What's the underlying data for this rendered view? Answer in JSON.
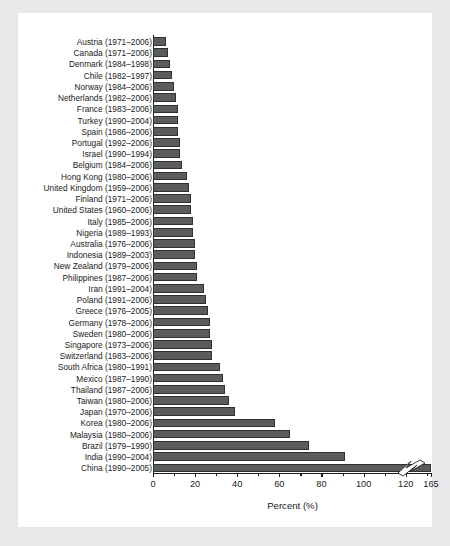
{
  "figure": {
    "axis_title": "Percent (%)",
    "bar_color": "#5c5c5c",
    "bar_edge_color": "#303030",
    "panel_background": "#ffffff",
    "page_background": "#e8e8ea",
    "break_symbol": "axis-break-zigzag"
  },
  "chart_data": {
    "type": "bar",
    "orientation": "horizontal",
    "title": "",
    "xlabel": "Percent (%)",
    "ylabel": "",
    "xlim": [
      0,
      132
    ],
    "grid": false,
    "legend": "none",
    "axis_break": {
      "present": true,
      "note": "Last tick labeled 165 although positioned at the 132 gridline; China bar is truncated with a zigzag break symbol.",
      "broken_category": "China (1990–2005)"
    },
    "xticks": [
      0,
      20,
      40,
      60,
      80,
      100,
      120,
      132
    ],
    "xticklabels": [
      "0",
      "20",
      "40",
      "60",
      "80",
      "100",
      "120",
      "165"
    ],
    "categories": [
      "Austria (1971–2006)",
      "Canada (1971–2006)",
      "Denmark  (1984–1998)",
      "Chile (1982–1997)",
      "Norway (1984–2006)",
      "Netherlands (1982–2006)",
      "France (1983–2006)",
      "Turkey (1990–2004)",
      "Spain (1986–2006)",
      "Portugal (1992–2006)",
      "Israel (1990–1994)",
      "Belgium (1984–2006)",
      "Hong Kong (1980–2006)",
      "United Kingdom (1959–2006)",
      "Finland (1971–2006)",
      "United States (1960–2006)",
      "Italy (1985–2006)",
      "Nigeria (1989–1993)",
      "Australia (1976–2006)",
      "Indonesia (1989–2003)",
      "New Zealand (1979–2006)",
      "Philippines (1987–2006)",
      "Iran (1991–2004)",
      "Poland (1991–2006)",
      "Greece (1976–2005)",
      "Germany (1978–2006)",
      "Sweden (1980–2006)",
      "Singapore (1973–2006)",
      "Switzerland (1983–2006)",
      "South Africa (1980–1991)",
      "Mexico (1987–1990)",
      "Thailand (1987–2006)",
      "Taiwan (1980–2006)",
      "Japan (1970–2006)",
      "Korea (1980–2006)",
      "Malaysia (1980–2006)",
      "Brazil (1979–1990)",
      "India (1990–2004)",
      "China (1990–2005)"
    ],
    "values": [
      6,
      7,
      8,
      9,
      10,
      11,
      12,
      12,
      12,
      13,
      13,
      14,
      16,
      17,
      18,
      18,
      19,
      19,
      20,
      20,
      21,
      21,
      24,
      25,
      26,
      27,
      27,
      28,
      28,
      32,
      33,
      34,
      36,
      39,
      58,
      65,
      74,
      91,
      132
    ],
    "values_note": "China plotted value is truncated at the axis break; its true value is 165."
  }
}
